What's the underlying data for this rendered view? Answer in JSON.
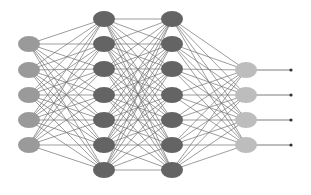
{
  "diagram": {
    "type": "neural-network",
    "colors": {
      "background": "#ffffff",
      "edge": "#6e6e6e",
      "input_node": "#9a9a9a",
      "hidden_node": "#646464",
      "output_node": "#bdbdbd",
      "output_terminal": "#333333"
    },
    "node_rx": 11,
    "node_ry": 8,
    "layers": [
      {
        "name": "input-layer",
        "role": "input",
        "x": 29,
        "ys": [
          44,
          70,
          95,
          120,
          145
        ]
      },
      {
        "name": "hidden-layer-1",
        "role": "hidden",
        "x": 104,
        "ys": [
          19,
          44,
          69,
          95,
          120,
          145,
          170
        ]
      },
      {
        "name": "hidden-layer-2",
        "role": "hidden",
        "x": 172,
        "ys": [
          19,
          44,
          69,
          95,
          120,
          145,
          170
        ]
      },
      {
        "name": "output-layer",
        "role": "output",
        "x": 246,
        "ys": [
          70,
          95,
          120,
          145
        ]
      }
    ],
    "output_arrows": {
      "end_x": 291
    }
  }
}
